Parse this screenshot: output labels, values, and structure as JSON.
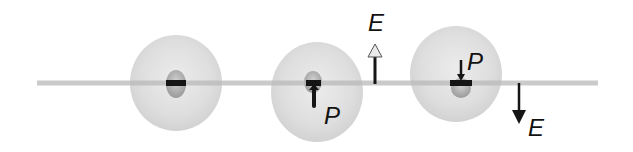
{
  "diagram": {
    "axis": {
      "x1": 37,
      "x2": 598,
      "y": 83,
      "color": "#c9c9c9"
    },
    "spheres": [
      {
        "id": "neutral",
        "cx": 176,
        "cy": 83,
        "rx": 46,
        "ry": 48,
        "core_cx": 176,
        "core_cy": 83,
        "polarization": "none"
      },
      {
        "id": "polarized-down",
        "cx": 317,
        "cy": 92,
        "rx": 46,
        "ry": 50,
        "core_cx": 313,
        "core_cy": 84,
        "polarization": "down",
        "p_label": "P"
      },
      {
        "id": "polarized-up",
        "cx": 456,
        "cy": 74,
        "rx": 46,
        "ry": 48,
        "core_cx": 461,
        "core_cy": 85,
        "polarization": "down",
        "p_label": "P"
      }
    ],
    "field_arrows": [
      {
        "id": "field-up",
        "x": 375,
        "y_start": 84,
        "y_end": 43,
        "direction": "up",
        "label": "E",
        "fill": "#e8e8e8"
      },
      {
        "id": "field-down",
        "x": 519,
        "y_start": 83,
        "y_end": 124,
        "direction": "down",
        "label": "E",
        "fill": "#111111"
      }
    ],
    "labels": {
      "p_sphere2": "P",
      "p_sphere3": "P",
      "e_up": "E",
      "e_down": "E"
    },
    "colors": {
      "sphere_fill": "#dcdcdc",
      "core_fill": "#a8a8a8",
      "dark": "#151515"
    }
  }
}
